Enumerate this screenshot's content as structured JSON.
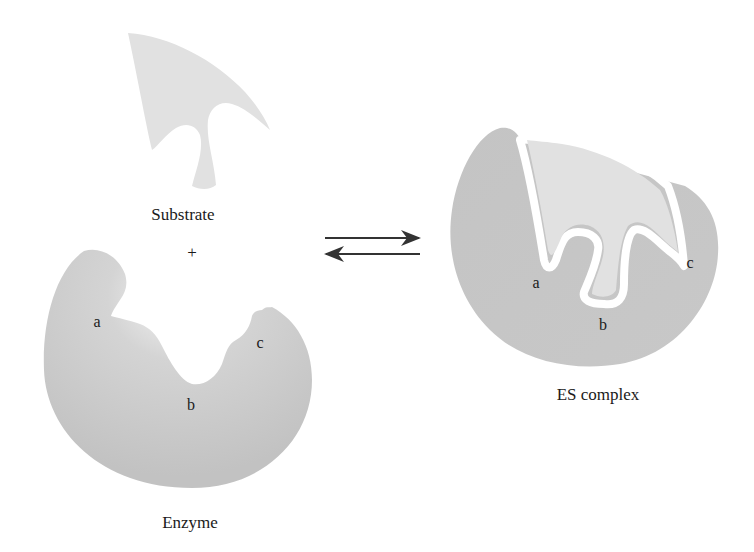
{
  "diagram": {
    "colors": {
      "enzyme": "#c6c6c6",
      "enzyme_light": "#ececec",
      "substrate": "#e1e1e1",
      "gap": "#ffffff",
      "text": "#1a1a1a",
      "arrow": "#333333"
    },
    "left": {
      "substrate_label": "Substrate",
      "plus": "+",
      "enzyme_label": "Enzyme",
      "sites": [
        "a",
        "b",
        "c"
      ]
    },
    "equilibrium": {
      "forward": "→",
      "reverse": "←"
    },
    "right": {
      "complex_label": "ES complex",
      "sites": [
        "a",
        "b",
        "c"
      ]
    }
  }
}
